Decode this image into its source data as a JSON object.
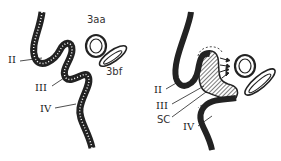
{
  "figure": {
    "panels": [
      {
        "id": "left",
        "labels": {
          "II": "II",
          "III": "III",
          "IV": "IV",
          "top_structure": "3aa",
          "side_structure": "3bf"
        }
      },
      {
        "id": "right",
        "labels": {
          "II": "II",
          "III": "III",
          "SC": "SC",
          "IV": "IV"
        }
      }
    ],
    "colors": {
      "ink": "#222222",
      "background": "#ffffff"
    }
  }
}
